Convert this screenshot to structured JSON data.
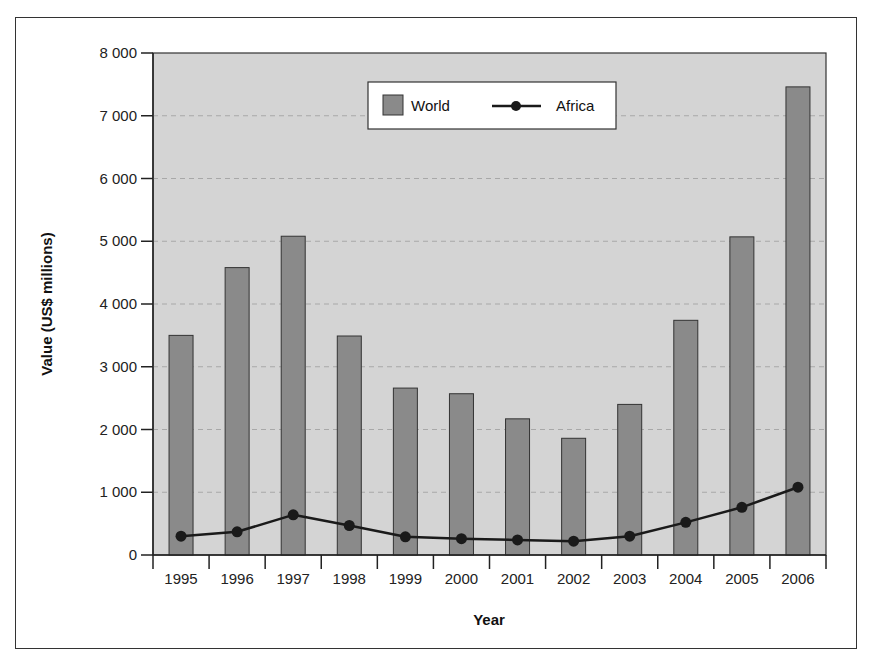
{
  "chart_data": {
    "type": "bar",
    "title": "",
    "xlabel": "Year",
    "ylabel": "Value (US$ millions)",
    "ylim": [
      0,
      8000
    ],
    "yticks": [
      0,
      1000,
      2000,
      3000,
      4000,
      5000,
      6000,
      7000,
      8000
    ],
    "ytick_labels": [
      "0",
      "1 000",
      "2 000",
      "3 000",
      "4 000",
      "5 000",
      "6 000",
      "7 000",
      "8 000"
    ],
    "grid": "horizontal dashed",
    "legend_position": "top center inside plot",
    "categories": [
      "1995",
      "1996",
      "1997",
      "1998",
      "1999",
      "2000",
      "2001",
      "2002",
      "2003",
      "2004",
      "2005",
      "2006"
    ],
    "series": [
      {
        "name": "World",
        "type": "bar",
        "color": "#8a8a8a",
        "values": [
          3500,
          4580,
          5080,
          3490,
          2660,
          2570,
          2170,
          1860,
          2400,
          3740,
          5070,
          7460
        ]
      },
      {
        "name": "Africa",
        "type": "line",
        "color": "#1a1a1a",
        "values": [
          300,
          370,
          640,
          470,
          290,
          260,
          240,
          220,
          300,
          520,
          760,
          1080
        ]
      }
    ]
  },
  "legend": {
    "world_label": "World",
    "africa_label": "Africa"
  },
  "axes": {
    "x_title": "Year",
    "y_title": "Value (US$ millions)"
  },
  "colors": {
    "plot_bg": "#d4d4d4",
    "bar_fill": "#8a8a8a",
    "bar_stroke": "#333333",
    "line": "#1a1a1a",
    "grid": "#a8a8a8"
  }
}
